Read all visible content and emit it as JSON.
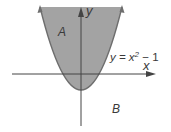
{
  "diagram": {
    "curve_label": "y = x",
    "curve_exp": "2",
    "curve_tail": " − 1",
    "x_axis_label": "x",
    "y_axis_label": "y",
    "region_inside_label": "A",
    "region_outside_label": "B",
    "colors": {
      "fill": "#a3a3a3",
      "curve": "#6e6e6e",
      "axis": "#444444",
      "text": "#3a3a3a",
      "background": "#ffffff"
    },
    "equation": "y = x^2 - 1"
  }
}
